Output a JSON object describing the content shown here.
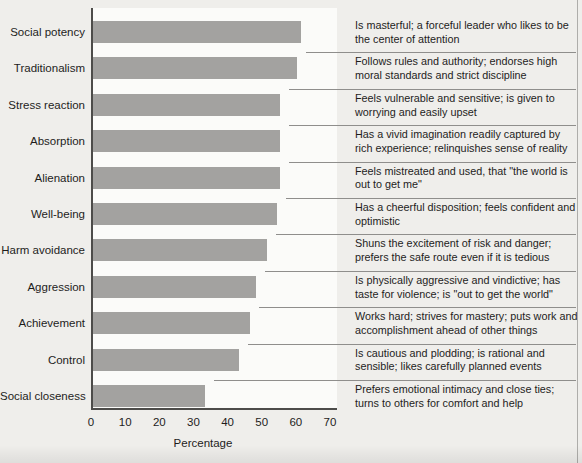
{
  "chart_data": {
    "type": "bar",
    "orientation": "horizontal",
    "title": "",
    "xlabel": "Percentage",
    "xlim": [
      0,
      70
    ],
    "xticks": [
      "0",
      "10",
      "20",
      "30",
      "40",
      "50",
      "60",
      "70"
    ],
    "grid": false,
    "legend": "none",
    "bar_color": "#a3a2a0",
    "categories": [
      "Social potency",
      "Traditionalism",
      "Stress reaction",
      "Absorption",
      "Alienation",
      "Well-being",
      "Harm avoidance",
      "Aggression",
      "Achievement",
      "Control",
      "Social closeness"
    ],
    "values": [
      61,
      60,
      55,
      55,
      55,
      54,
      51,
      48,
      46,
      43,
      33
    ],
    "descriptions": [
      "Is masterful; a forceful leader who likes to be the center of attention",
      "Follows rules and authority; endorses high moral standards and strict discipline",
      "Feels vulnerable and sensitive; is given to worrying and easily upset",
      "Has a vivid imagination readily captured by rich experience; relinquishes sense of reality",
      "Feels mistreated and used, that \"the world is out to get me\"",
      "Has a cheerful disposition; feels confident and optimistic",
      "Shuns the excitement of risk and danger; prefers the safe route even if it is tedious",
      "Is physically aggressive and vindictive; has taste for violence; is \"out to get the world\"",
      "Works hard; strives for mastery; puts work and accomplishment ahead of other things",
      "Is cautious and plodding; is rational and sensible; likes carefully planned events",
      "Prefers emotional intimacy and close ties; turns to others for comfort and help"
    ]
  }
}
